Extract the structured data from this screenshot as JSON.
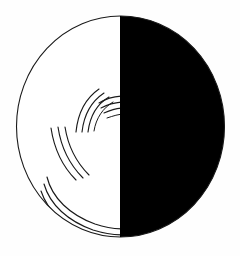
{
  "artwork": {
    "title": "Half-filled circle emblem with swirling arc rays",
    "type": "monochrome-logo",
    "canvas": {
      "width": 240,
      "height": 256,
      "background": "#fefefe"
    },
    "colors": {
      "background": "#fefefe",
      "fill_dark": "#000000",
      "fill_light": "#ffffff",
      "stroke": "#1a1a1a"
    },
    "circle": {
      "name": "outer-circle",
      "center_x": 120.5,
      "center_y": 126.5,
      "radius_x": 104,
      "radius_y": 110.5,
      "outline_width": 1.1,
      "outline_color": "#1a1a1a"
    },
    "halves": [
      {
        "name": "left-half",
        "side": "left",
        "fill": "#ffffff",
        "description": "white hemisphere containing arc ray groups"
      },
      {
        "name": "right-half",
        "side": "right",
        "fill": "#000000",
        "description": "solid black hemisphere"
      }
    ],
    "divider": {
      "name": "vertical-divider",
      "x": 120.5,
      "y_top": 16,
      "y_bottom": 237,
      "color": "#000000",
      "width": 1
    },
    "ray_groups": [
      {
        "name": "upper-left-ray-group",
        "count": 4,
        "orientation": "steep-vertical",
        "stroke_width": 1.1,
        "description": "four short steep arcs angling up-right toward the divider"
      },
      {
        "name": "upper-right-ray-group",
        "count": 4,
        "orientation": "shallow-horizontal",
        "stroke_width": 1.1,
        "description": "four short shallow arcs curving right into the divider"
      },
      {
        "name": "middle-left-ray-group",
        "count": 3,
        "orientation": "diagonal",
        "stroke_width": 1.1,
        "description": "three long sweeping arcs descending from upper-left"
      },
      {
        "name": "lower-ray-group",
        "count": 4,
        "orientation": "sweeping-horizontal",
        "stroke_width": 1.1,
        "description": "four long arcs sweeping from lower-left across to the divider"
      }
    ]
  }
}
